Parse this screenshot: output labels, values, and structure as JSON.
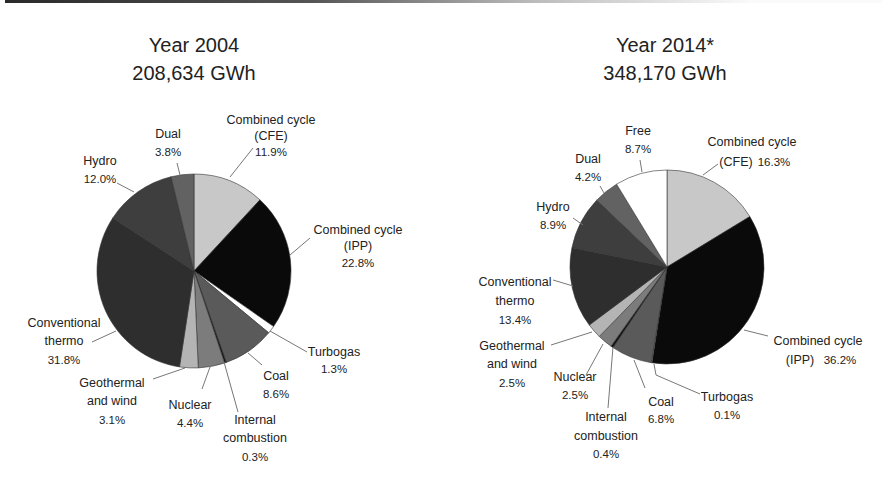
{
  "chart_data": [
    {
      "type": "pie",
      "title": "Year 2004",
      "subtitle": "208,634 GWh",
      "start": "12 o'clock, clockwise",
      "slices": [
        {
          "label": "Combined cycle (CFE)",
          "value": 11.9,
          "display": "11.9%",
          "color": "#c8c8c8"
        },
        {
          "label": "Combined cycle (IPP)",
          "value": 22.8,
          "display": "22.8%",
          "color": "#0a0a0a"
        },
        {
          "label": "Turbogas",
          "value": 1.3,
          "display": "1.3%",
          "color": "#ffffff"
        },
        {
          "label": "Coal",
          "value": 8.6,
          "display": "8.6%",
          "color": "#5a5a5a"
        },
        {
          "label": "Internal combustion",
          "value": 0.3,
          "display": "0.3%",
          "color": "#111111"
        },
        {
          "label": "Nuclear",
          "value": 4.4,
          "display": "4.4%",
          "color": "#7c7c7c"
        },
        {
          "label": "Geothermal and wind",
          "value": 3.1,
          "display": "3.1%",
          "color": "#b4b4b4"
        },
        {
          "label": "Conventional thermo",
          "value": 31.8,
          "display": "31.8%",
          "color": "#2e2e2e"
        },
        {
          "label": "Hydro",
          "value": 12.0,
          "display": "12.0%",
          "color": "#3e3e3e"
        },
        {
          "label": "Dual",
          "value": 3.8,
          "display": "3.8%",
          "color": "#626262"
        }
      ]
    },
    {
      "type": "pie",
      "title": "Year 2014*",
      "subtitle": "348,170 GWh",
      "start": "12 o'clock, clockwise",
      "slices": [
        {
          "label": "Combined cycle (CFE)",
          "value": 16.3,
          "display": "16.3%",
          "color": "#c8c8c8"
        },
        {
          "label": "Combined cycle (IPP)",
          "value": 36.2,
          "display": "36.2%",
          "color": "#0a0a0a"
        },
        {
          "label": "Turbogas",
          "value": 0.1,
          "display": "0.1%",
          "color": "#ffffff"
        },
        {
          "label": "Coal",
          "value": 6.8,
          "display": "6.8%",
          "color": "#5a5a5a"
        },
        {
          "label": "Internal combustion",
          "value": 0.4,
          "display": "0.4%",
          "color": "#111111"
        },
        {
          "label": "Nuclear",
          "value": 2.5,
          "display": "2.5%",
          "color": "#7c7c7c"
        },
        {
          "label": "Geothermal and wind",
          "value": 2.5,
          "display": "2.5%",
          "color": "#b4b4b4"
        },
        {
          "label": "Conventional thermo",
          "value": 13.4,
          "display": "13.4%",
          "color": "#2e2e2e"
        },
        {
          "label": "Hydro",
          "value": 8.9,
          "display": "8.9%",
          "color": "#3e3e3e"
        },
        {
          "label": "Dual",
          "value": 4.2,
          "display": "4.2%",
          "color": "#626262"
        },
        {
          "label": "Free",
          "value": 8.7,
          "display": "8.7%",
          "color": "#ffffff"
        }
      ]
    }
  ],
  "labels": {
    "left": {
      "cfe": [
        "Combined cycle",
        "(CFE)",
        "11.9%"
      ],
      "ipp": [
        "Combined cycle",
        "(IPP)",
        "22.8%"
      ],
      "turbogas": [
        "Turbogas",
        "1.3%"
      ],
      "coal": [
        "Coal",
        "8.6%"
      ],
      "internal": [
        "Internal",
        "combustion",
        "0.3%"
      ],
      "nuclear": [
        "Nuclear",
        "4.4%"
      ],
      "geo": [
        "Geothermal",
        "and wind",
        "3.1%"
      ],
      "conv": [
        "Conventional",
        "thermo",
        "31.8%"
      ],
      "hydro": [
        "Hydro",
        "12.0%"
      ],
      "dual": [
        "Dual",
        "3.8%"
      ]
    },
    "right": {
      "cfe": [
        "Combined cycle",
        "(CFE)",
        "16.3%"
      ],
      "ipp": [
        "Combined cycle",
        "(IPP)",
        "36.2%"
      ],
      "turbogas": [
        "Turbogas",
        "0.1%"
      ],
      "coal": [
        "Coal",
        "6.8%"
      ],
      "internal": [
        "Internal",
        "combustion",
        "0.4%"
      ],
      "nuclear": [
        "Nuclear",
        "2.5%"
      ],
      "geo": [
        "Geothermal",
        "and wind",
        "2.5%"
      ],
      "conv": [
        "Conventional",
        "thermo",
        "13.4%"
      ],
      "hydro": [
        "Hydro",
        "8.9%"
      ],
      "dual": [
        "Dual",
        "4.2%"
      ],
      "free": [
        "Free",
        "8.7%"
      ]
    }
  }
}
